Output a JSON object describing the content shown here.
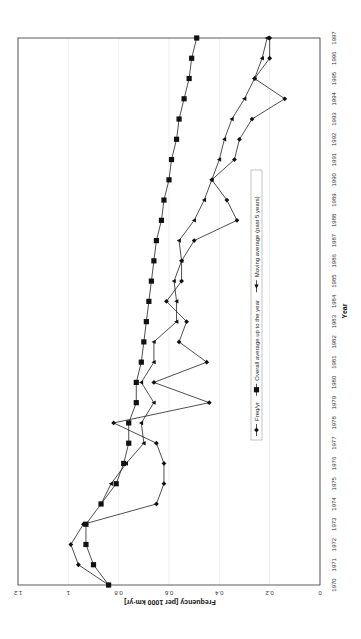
{
  "chart_data": {
    "type": "line",
    "orientation": "rotated 90 degrees clockwise",
    "title": "",
    "xlabel": "Year",
    "ylabel": "Frequency [per 1000 km·yr]",
    "ylim": [
      0,
      1.2
    ],
    "yticks": [
      "0",
      "0.2",
      "0.4",
      "0.6",
      "0.8",
      "1",
      "1.2"
    ],
    "x": [
      1970,
      1971,
      1972,
      1973,
      1974,
      1975,
      1976,
      1977,
      1978,
      1979,
      1980,
      1981,
      1982,
      1983,
      1984,
      1985,
      1986,
      1987,
      1988,
      1989,
      1990,
      1991,
      1992,
      1993,
      1994,
      1995,
      1996,
      1997
    ],
    "grid": true,
    "legend_position": "inside, center-right",
    "series": [
      {
        "name": "Freq/yr",
        "marker": "diamond",
        "values": [
          0.84,
          0.96,
          0.99,
          0.94,
          0.65,
          0.62,
          0.62,
          0.65,
          0.82,
          0.44,
          0.66,
          0.45,
          0.56,
          0.53,
          0.61,
          0.55,
          0.55,
          0.5,
          0.33,
          0.37,
          0.43,
          0.34,
          0.32,
          0.27,
          0.14,
          0.26,
          0.2,
          0.2
        ]
      },
      {
        "name": "Overall average up to the year",
        "marker": "square",
        "values": [
          0.84,
          0.9,
          0.93,
          0.93,
          0.87,
          0.81,
          0.78,
          0.76,
          0.76,
          0.73,
          0.73,
          0.71,
          0.7,
          0.69,
          0.68,
          0.67,
          0.66,
          0.65,
          0.63,
          0.62,
          0.6,
          0.59,
          0.57,
          0.56,
          0.54,
          0.52,
          0.51,
          0.49
        ]
      },
      {
        "name": "Moving average (past 5 years)",
        "marker": "triangle",
        "values": [
          null,
          null,
          null,
          null,
          0.87,
          0.83,
          0.77,
          0.7,
          0.71,
          0.66,
          0.71,
          0.66,
          0.66,
          0.57,
          0.57,
          0.58,
          0.55,
          0.56,
          0.5,
          0.46,
          0.43,
          0.4,
          0.38,
          0.35,
          0.3,
          0.26,
          0.23,
          0.21
        ]
      }
    ]
  },
  "legend": {
    "items": [
      "Freq/yr",
      "Overall average up to the year",
      "Moving average (past 5 years)"
    ]
  },
  "axes": {
    "xlabel": "Year",
    "ylabel": "Frequency [per 1000 km·yr]"
  }
}
